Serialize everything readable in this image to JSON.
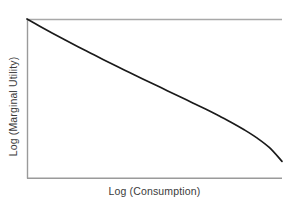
{
  "figure": {
    "background_color": "#ffffff",
    "axis_color": "#9a9a9a",
    "curve_color": "#1a1a1a",
    "text_color": "#3b3b3b"
  },
  "chart_data": {
    "type": "line",
    "title": "",
    "subtitle": "",
    "xlabel": "Log (Consumption)",
    "ylabel": "Log (Marginal Utility)",
    "xlim": [
      0,
      1
    ],
    "ylim": [
      0,
      1
    ],
    "xticks": [],
    "yticks": [],
    "xticklabels": [],
    "yticklabels": [],
    "grid": false,
    "legend": false,
    "legend_position": "none",
    "annotations": [],
    "series": [
      {
        "name": "Log marginal utility",
        "x": [
          0.0,
          0.05,
          0.1,
          0.15,
          0.2,
          0.25,
          0.3,
          0.35,
          0.4,
          0.45,
          0.5,
          0.55,
          0.6,
          0.65,
          0.7,
          0.75,
          0.8,
          0.85,
          0.9,
          0.95,
          1.0
        ],
        "y": [
          1.0,
          0.955,
          0.911,
          0.868,
          0.826,
          0.785,
          0.744,
          0.704,
          0.665,
          0.626,
          0.588,
          0.549,
          0.511,
          0.472,
          0.434,
          0.393,
          0.351,
          0.305,
          0.254,
          0.192,
          0.105
        ]
      }
    ],
    "pixel_geometry": {
      "plot_left_px": 27,
      "plot_right_px": 282,
      "plot_top_px": 19,
      "plot_bottom_px": 178,
      "curve_start_px": [
        27,
        20
      ],
      "curve_end_px": [
        278,
        178
      ]
    }
  },
  "axes": {
    "y_axis_label": "Log (Marginal Utility)",
    "x_axis_label": "Log (Consumption)"
  }
}
